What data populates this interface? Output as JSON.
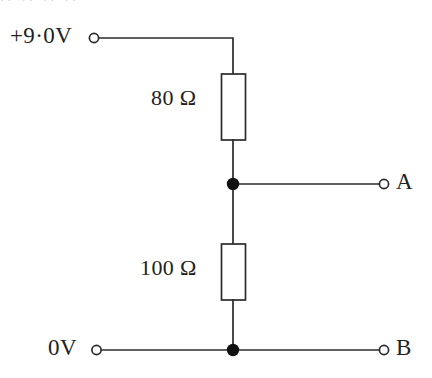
{
  "figure": {
    "kind": "circuit-diagram",
    "width": 432,
    "height": 378,
    "background_color": "#ffffff",
    "line_color": "#2b2b2b",
    "node_color": "#111111"
  },
  "labels": {
    "supply": "+9·0V",
    "ground": "0V",
    "resistor_top": "80 Ω",
    "resistor_bottom": "100 Ω",
    "terminal_a": "A",
    "terminal_b": "B"
  },
  "clipped_header": {
    "text": "ıı                    ıı                              ıı                 ıı"
  },
  "components": [
    {
      "name": "resistor-80-ohm",
      "type": "resistor",
      "value": "80 Ω",
      "resistance_ohms": 80,
      "position": "upper branch, between +9.0 V rail and node A"
    },
    {
      "name": "resistor-100-ohm",
      "type": "resistor",
      "value": "100 Ω",
      "resistance_ohms": 100,
      "position": "lower branch, between node A and 0 V rail"
    }
  ],
  "terminals": [
    {
      "name": "supply-terminal",
      "label": "+9·0V",
      "style": "open-circle"
    },
    {
      "name": "ground-terminal",
      "label": "0V",
      "style": "open-circle"
    },
    {
      "name": "output-terminal-a",
      "label": "A",
      "style": "open-circle"
    },
    {
      "name": "output-terminal-b",
      "label": "B",
      "style": "open-circle"
    }
  ],
  "junctions": [
    {
      "name": "node-a-junction",
      "style": "filled-dot"
    },
    {
      "name": "node-b-junction",
      "style": "filled-dot"
    }
  ]
}
